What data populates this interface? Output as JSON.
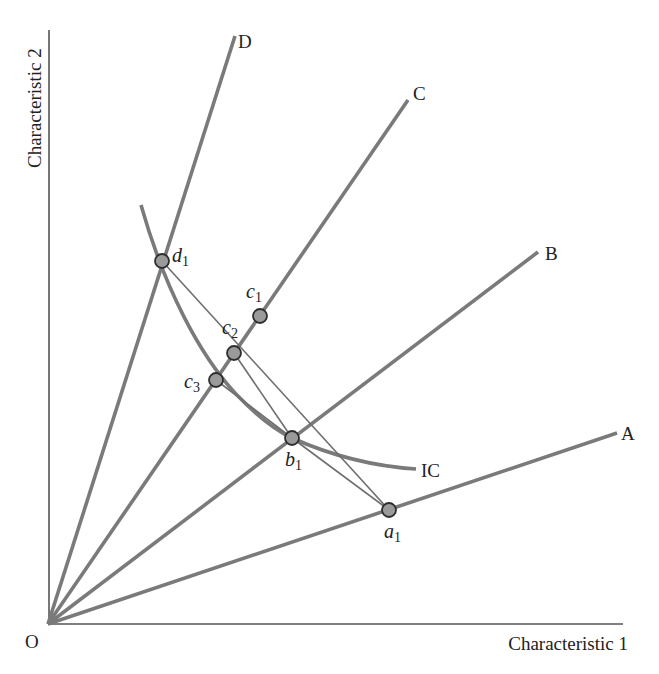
{
  "diagram": {
    "type": "indifference-curve-characteristics",
    "axes": {
      "origin": {
        "x": 48,
        "y": 624
      },
      "x_axis_end": {
        "x": 623,
        "y": 624
      },
      "y_axis_end": {
        "x": 49,
        "y": 30
      },
      "x_label": "Characteristic 1",
      "y_label": "Characteristic 2",
      "origin_label": "O"
    },
    "rays": [
      {
        "id": "A",
        "label": "A",
        "end": {
          "x": 617,
          "y": 433
        },
        "label_pos": {
          "x": 621,
          "y": 440
        }
      },
      {
        "id": "B",
        "label": "B",
        "end": {
          "x": 538,
          "y": 252
        },
        "label_pos": {
          "x": 545,
          "y": 260
        }
      },
      {
        "id": "C",
        "label": "C",
        "end": {
          "x": 408,
          "y": 100
        },
        "label_pos": {
          "x": 413,
          "y": 100
        }
      },
      {
        "id": "D",
        "label": "D",
        "end": {
          "x": 235,
          "y": 36
        },
        "label_pos": {
          "x": 238,
          "y": 48
        }
      }
    ],
    "indifference_curve": {
      "label": "IC",
      "path": "M141,205 C165,290 200,355 235,393 C255,414 275,430 292,438 C330,455 370,466 416,469",
      "label_pos": {
        "x": 421,
        "y": 477
      }
    },
    "points": [
      {
        "id": "a1",
        "base": "a",
        "sub": "1",
        "x": 389,
        "y": 510,
        "label_pos": {
          "x": 384,
          "y": 538
        }
      },
      {
        "id": "b1",
        "base": "b",
        "sub": "1",
        "x": 292,
        "y": 438,
        "label_pos": {
          "x": 285,
          "y": 466
        }
      },
      {
        "id": "c1",
        "base": "c",
        "sub": "1",
        "x": 260,
        "y": 316,
        "label_pos": {
          "x": 246,
          "y": 298
        }
      },
      {
        "id": "c2",
        "base": "c",
        "sub": "2",
        "x": 234,
        "y": 353,
        "label_pos": {
          "x": 222,
          "y": 334
        }
      },
      {
        "id": "c3",
        "base": "c",
        "sub": "3",
        "x": 216,
        "y": 380,
        "label_pos": {
          "x": 184,
          "y": 388
        }
      },
      {
        "id": "d1",
        "base": "d",
        "sub": "1",
        "x": 162,
        "y": 261,
        "label_pos": {
          "x": 172,
          "y": 262
        }
      }
    ],
    "budget_lines": [
      {
        "from": "d1",
        "to": "a1"
      },
      {
        "from": "c2",
        "to": "b1"
      },
      {
        "from": "c3",
        "to": "b1"
      },
      {
        "from": "b1",
        "to": "a1"
      }
    ],
    "colors": {
      "ray": "#7a7a7a",
      "thin_line": "#6e6e6e",
      "axis": "#555555",
      "point_fill": "#9a9a9a",
      "point_stroke": "#2e2e2e",
      "text": "#222222"
    }
  }
}
